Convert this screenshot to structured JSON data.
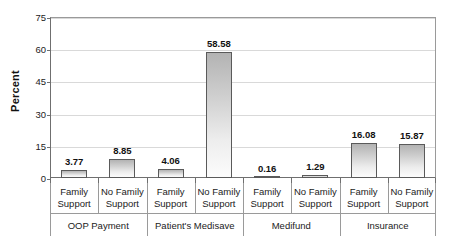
{
  "chart_data": {
    "type": "bar",
    "title": "",
    "subtitle": "",
    "xlabel": "",
    "ylabel": "Percent",
    "ylim": [
      0,
      75
    ],
    "yticks": [
      0,
      15,
      30,
      45,
      60,
      75
    ],
    "ytick_labels": [
      "0",
      "15",
      "30",
      "45",
      "60",
      "75"
    ],
    "grid": true,
    "legend": false,
    "legend_position": "none",
    "categories": [
      "Family Support",
      "No Family Support",
      "Family Support",
      "No Family Support",
      "Family Support",
      "No Family Support",
      "Family Support",
      "No Family Support"
    ],
    "category_lines": [
      [
        "Family",
        "Support"
      ],
      [
        "No Family",
        "Support"
      ],
      [
        "Family",
        "Support"
      ],
      [
        "No Family",
        "Support"
      ],
      [
        "Family",
        "Support"
      ],
      [
        "No Family",
        "Support"
      ],
      [
        "Family",
        "Support"
      ],
      [
        "No Family",
        "Support"
      ]
    ],
    "groups": [
      {
        "label": "OOP Payment",
        "span": 2
      },
      {
        "label": "Patient's Medisave",
        "span": 2
      },
      {
        "label": "Medifund",
        "span": 2
      },
      {
        "label": "Insurance",
        "span": 2
      }
    ],
    "values": [
      3.77,
      8.85,
      4.06,
      58.58,
      0.16,
      1.29,
      16.08,
      15.87
    ],
    "data_labels": [
      "3.77",
      "8.85",
      "4.06",
      "58.58",
      "0.16",
      "1.29",
      "16.08",
      "15.87"
    ],
    "colors": {
      "bar_gradient_top": "#b3b3b3",
      "bar_gradient_bottom": "#fcfcfc",
      "bar_border": "#5a5a5a",
      "gridline": "#d9d9d9",
      "axis": "#6f6f6f",
      "text": "#1a1a1a",
      "background": "#ffffff"
    }
  }
}
